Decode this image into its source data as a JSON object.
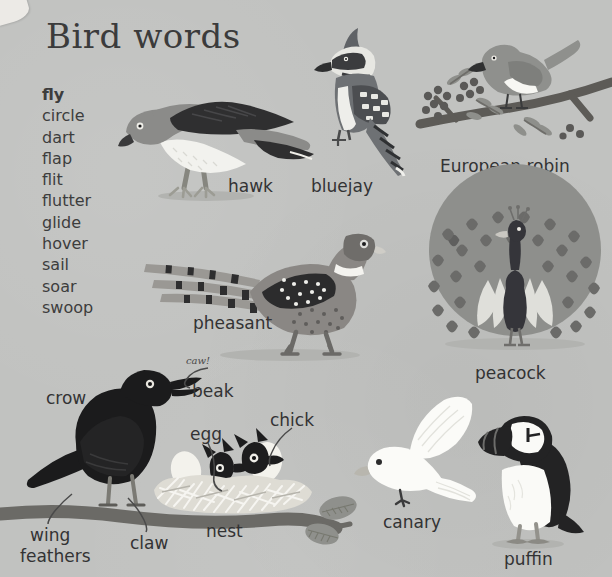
{
  "page": {
    "title": "Bird words",
    "background_color": "#c1c2c0",
    "text_color": "#333334"
  },
  "word_list": {
    "name": "bird-action-words",
    "items": [
      {
        "text": "fly",
        "bold": true
      },
      {
        "text": "circle",
        "bold": false
      },
      {
        "text": "dart",
        "bold": false
      },
      {
        "text": "flap",
        "bold": false
      },
      {
        "text": "flit",
        "bold": false
      },
      {
        "text": "flutter",
        "bold": false
      },
      {
        "text": "glide",
        "bold": false
      },
      {
        "text": "hover",
        "bold": false
      },
      {
        "text": "sail",
        "bold": false
      },
      {
        "text": "soar",
        "bold": false
      },
      {
        "text": "swoop",
        "bold": false
      }
    ]
  },
  "labels": {
    "hawk": "hawk",
    "bluejay": "bluejay",
    "european_robin": "European robin",
    "pheasant": "pheasant",
    "peacock": "peacock",
    "crow": "crow",
    "caw": "caw!",
    "beak": "beak",
    "egg": "egg",
    "chick": "chick",
    "nest": "nest",
    "claw": "claw",
    "wing_feathers_line1": "wing",
    "wing_feathers_line2": "feathers",
    "canary": "canary",
    "puffin": "puffin"
  },
  "colors": {
    "background": "#c1c2c0",
    "ink": "#333334",
    "crow_black": "#1b1b1c",
    "branch_brown": "#6b6a66",
    "hawk_gray": "#8b8b89",
    "hawk_dark": "#2f2f30",
    "hawk_white": "#f2f2ee",
    "bluejay_body": "#6e7174",
    "peacock_fan": "#8e8f8c",
    "peacock_body": "#35353a",
    "pheasant_body": "#8a8784",
    "canary_white": "#fbfbf8",
    "puffin_black": "#232324",
    "puffin_white": "#fafaf7",
    "robin_gray": "#8f908d",
    "nest_light": "#e9e8e2"
  }
}
